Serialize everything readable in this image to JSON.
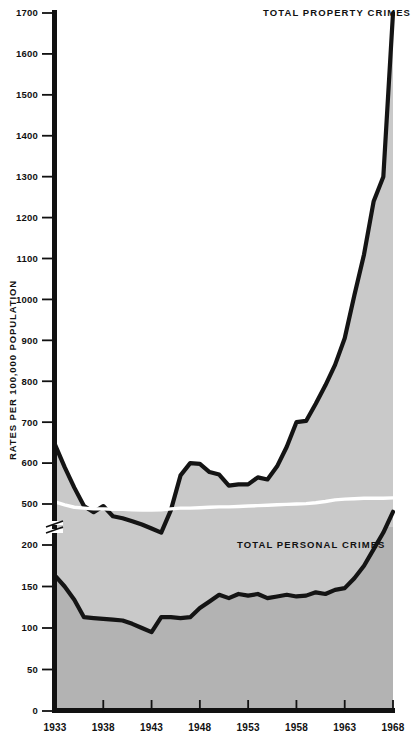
{
  "chart_data": {
    "type": "area",
    "title": "",
    "subtitle": "",
    "xlabel": "",
    "ylabel": "RATES PER 100,000 POPULATION",
    "grid": false,
    "legend_position": "inline-annotations",
    "x": [
      1933,
      1934,
      1935,
      1936,
      1937,
      1938,
      1939,
      1940,
      1941,
      1942,
      1943,
      1944,
      1945,
      1946,
      1947,
      1948,
      1949,
      1950,
      1951,
      1952,
      1953,
      1954,
      1955,
      1956,
      1957,
      1958,
      1959,
      1960,
      1961,
      1962,
      1963,
      1964,
      1965,
      1966,
      1967,
      1968
    ],
    "xlim": [
      1933,
      1968
    ],
    "xticks": [
      1933,
      1938,
      1943,
      1948,
      1953,
      1958,
      1963,
      1968
    ],
    "xticklabels": [
      "1933",
      "1938",
      "1943",
      "1948",
      "1953",
      "1958",
      "1963",
      "1968"
    ],
    "yticks_upper": [
      500,
      600,
      700,
      800,
      900,
      1000,
      1100,
      1200,
      1300,
      1400,
      1500,
      1600,
      1700
    ],
    "yticks_lower": [
      0,
      50,
      100,
      150,
      200
    ],
    "axis_break": {
      "present": true,
      "below": 200,
      "above": 500
    },
    "ylim_upper": [
      500,
      1700
    ],
    "ylim_lower": [
      0,
      200
    ],
    "series": [
      {
        "name": "TOTAL PROPERTY CRIMES",
        "annotation": "TOTAL PROPERTY CRIMES",
        "values": [
          645,
          590,
          540,
          495,
          480,
          495,
          470,
          465,
          458,
          450,
          440,
          430,
          485,
          570,
          600,
          598,
          578,
          572,
          545,
          548,
          548,
          565,
          560,
          592,
          640,
          700,
          703,
          745,
          790,
          840,
          905,
          1010,
          1110,
          1240,
          1300,
          1700
        ]
      },
      {
        "name": "TOTAL PERSONAL CRIMES",
        "annotation": "TOTAL PERSONAL CRIMES",
        "values": [
          163,
          150,
          134,
          113,
          112,
          111,
          110,
          109,
          105,
          100,
          95,
          113,
          113,
          112,
          113,
          124,
          132,
          140,
          136,
          141,
          139,
          141,
          136,
          138,
          140,
          138,
          139,
          143,
          141,
          146,
          148,
          160,
          175,
          195,
          215,
          240
        ]
      },
      {
        "name": "axis-break-divider",
        "annotation": "",
        "style": "white-line",
        "values_upper_edge": [
          505,
          498,
          492,
          490,
          488,
          488,
          487,
          487,
          486,
          485,
          485,
          486,
          488,
          490,
          490,
          491,
          492,
          493,
          493,
          494,
          495,
          496,
          497,
          498,
          499,
          500,
          501,
          503,
          506,
          510,
          512,
          513,
          514,
          514,
          514,
          515
        ]
      }
    ],
    "colors": {
      "property_fill": "#c8c8c8",
      "personal_fill": "#b4b4b4",
      "line": "#141414",
      "divider": "#ffffff",
      "axis": "#111111",
      "background": "#ffffff"
    }
  },
  "axis": {
    "y_title": "RATES PER 100,000 POPULATION",
    "y_labels_upper": [
      "1700",
      "1600",
      "1500",
      "1400",
      "1300",
      "1200",
      "1100",
      "1000",
      "900",
      "800",
      "700",
      "600",
      "500"
    ],
    "y_labels_lower": [
      "200",
      "150",
      "100",
      "50",
      "0"
    ],
    "x_labels": [
      "1933",
      "1938",
      "1943",
      "1948",
      "1953",
      "1958",
      "1963",
      "1968"
    ]
  },
  "annotations": {
    "property": "TOTAL PROPERTY CRIMES",
    "personal": "TOTAL PERSONAL CRIMES"
  }
}
